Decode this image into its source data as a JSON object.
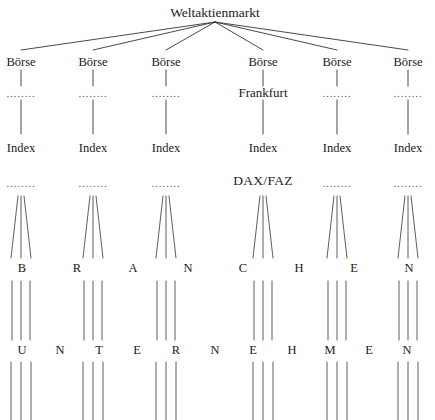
{
  "diagram": {
    "title": "Weltaktienmarkt",
    "stroke_color": "#33343a",
    "text_color": "#1a1a1a",
    "background_color": "#ffffff",
    "dots_text": "........",
    "levels": [
      {
        "level_name": "root",
        "label": "Weltaktienmarkt",
        "x": 215,
        "y": 12
      },
      {
        "level_name": "boerse",
        "labels": [
          "Börse",
          "Börse",
          "Börse",
          "Börse",
          "Börse",
          "Börse"
        ],
        "y": 62
      },
      {
        "level_name": "boerse-detail",
        "labels": [
          "........",
          "........",
          "........",
          "Frankfurt",
          "........",
          "........"
        ],
        "named_index": 3,
        "named_label": "Frankfurt",
        "y": 92
      },
      {
        "level_name": "index",
        "labels": [
          "Index",
          "Index",
          "Index",
          "Index",
          "Index",
          "Index"
        ],
        "y": 148
      },
      {
        "level_name": "index-detail",
        "labels": [
          "........",
          "........",
          "........",
          "DAX/FAZ",
          "........",
          "........"
        ],
        "named_index": 3,
        "named_label": "DAX/FAZ",
        "y": 181
      },
      {
        "level_name": "branchen",
        "word": "BRANCHEN",
        "letters": [
          "B",
          "R",
          "A",
          "N",
          "C",
          "H",
          "E",
          "N"
        ],
        "y": 268
      },
      {
        "level_name": "unternehmen",
        "word": "UNTERNEHMEN",
        "letters": [
          "U",
          "N",
          "T",
          "E",
          "R",
          "N",
          "E",
          "H",
          "M",
          "E",
          "N"
        ],
        "y": 350
      }
    ],
    "column_x": [
      21,
      93,
      166,
      263,
      337,
      408
    ],
    "branchen_letter_x": [
      22,
      77,
      133,
      188,
      243,
      299,
      354,
      409
    ],
    "unternehmen_letter_x": [
      22,
      60,
      99,
      137,
      176,
      215,
      253,
      292,
      330,
      369,
      407
    ],
    "fan_apex": {
      "x": 215,
      "y": 22
    },
    "fan_target_y": 50,
    "connector_top_y": 70,
    "connector_bottom_y": 86,
    "connector2_top_y": 100,
    "connector2_bottom_y": 134,
    "branch_group_top_y": 196,
    "branch_group_bottom_y": 258,
    "branch_group_half_width_top": 3,
    "branch_group_half_width_bottom": 10,
    "mid_group_top_y": 281,
    "mid_group_bottom_y": 340,
    "mid_group_half_width": 9,
    "bottom_group_top_y": 362,
    "bottom_group_bottom_y": 420,
    "bottom_group_half_width": 10,
    "lines_per_group": 3
  }
}
